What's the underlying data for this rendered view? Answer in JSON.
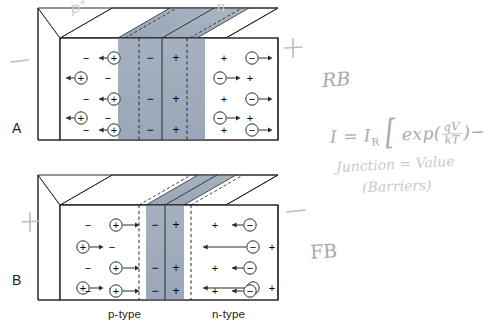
{
  "figure": {
    "colors": {
      "depletion_fill": "#9aa7b8",
      "depletion_fill_light": "#b6c0cd",
      "body_fill": "#ffffff",
      "outline": "#2b2b2b",
      "pencil": "#b9b9bd",
      "text": "#1d1d1d"
    }
  },
  "panels": [
    {
      "id": "A",
      "letter": "A",
      "bias_mode": "reverse",
      "terminal_left": "−",
      "terminal_right": "+",
      "p_side": {
        "fixed_charge_symbol": "−",
        "mobile_carrier_symbol": "+",
        "carrier_count": 5,
        "arrow_direction": "left",
        "rows": [
          {
            "fixed": "−",
            "carrier": "+",
            "carrier_side": "right"
          },
          {
            "fixed": "−",
            "carrier": "+",
            "carrier_side": "left"
          },
          {
            "fixed": "−",
            "carrier": "+",
            "carrier_side": "right"
          },
          {
            "fixed": "−",
            "carrier": "+",
            "carrier_side": "left"
          },
          {
            "fixed": "−",
            "carrier": "+",
            "carrier_side": "right"
          }
        ]
      },
      "n_side": {
        "fixed_charge_symbol": "+",
        "mobile_carrier_symbol": "−",
        "carrier_count": 5,
        "arrow_direction": "right",
        "rows": [
          {
            "fixed": "+",
            "carrier": "−",
            "carrier_side": "right"
          },
          {
            "fixed": "+",
            "carrier": "−",
            "carrier_side": "left"
          },
          {
            "fixed": "+",
            "carrier": "−",
            "carrier_side": "right"
          },
          {
            "fixed": "+",
            "carrier": "−",
            "carrier_side": "left"
          },
          {
            "fixed": "+",
            "carrier": "−",
            "carrier_side": "right"
          }
        ]
      },
      "depletion": {
        "width_label": "wide",
        "left_column_symbol": "−",
        "right_column_symbol": "+",
        "symbol_rows": 3
      }
    },
    {
      "id": "B",
      "letter": "B",
      "bias_mode": "forward",
      "terminal_left": "+",
      "terminal_right": "−",
      "p_side": {
        "fixed_charge_symbol": "−",
        "mobile_carrier_symbol": "+",
        "carrier_count": 5,
        "arrow_direction": "right",
        "rows": [
          {
            "fixed": "−",
            "carrier": "+",
            "carrier_side": "right"
          },
          {
            "fixed": "−",
            "carrier": "+",
            "carrier_side": "left"
          },
          {
            "fixed": "−",
            "carrier": "+",
            "carrier_side": "right"
          },
          {
            "fixed": "−",
            "carrier": "+",
            "carrier_side": "left"
          },
          {
            "fixed": "−",
            "carrier": "+",
            "carrier_side": "right"
          }
        ]
      },
      "n_side": {
        "fixed_charge_symbol": "+",
        "mobile_carrier_symbol": "−",
        "carrier_count": 5,
        "arrow_direction": "left",
        "rows": [
          {
            "fixed": "+",
            "carrier": "−",
            "carrier_side": "right"
          },
          {
            "fixed": "+",
            "carrier": "−",
            "carrier_side": "left"
          },
          {
            "fixed": "+",
            "carrier": "−",
            "carrier_side": "right"
          },
          {
            "fixed": "+",
            "carrier": "−",
            "carrier_side": "left"
          },
          {
            "fixed": "+",
            "carrier": "−",
            "carrier_side": "right"
          }
        ]
      },
      "depletion": {
        "width_label": "narrow",
        "left_column_symbol": "−",
        "right_column_symbol": "+",
        "symbol_rows": 3
      }
    }
  ],
  "axis_labels": {
    "p_type": "p-type",
    "n_type": "n-type"
  },
  "handwriting": {
    "top_p": "p",
    "top_p_sup": "+",
    "top_n": "n",
    "reverse_bias": "RB",
    "forward_bias": "FB",
    "equation": {
      "lhs": "I",
      "equals": "=",
      "prefactor": "I",
      "prefactor_sub": "R",
      "bracket_open": "[",
      "exp": "exp",
      "paren_open": "(",
      "frac_num": "qV",
      "frac_den": "kT",
      "paren_close": ")",
      "minus_tail": "−"
    },
    "note_line_1_left": "J",
    "note_line_1_rest": "unction",
    "note_line_1_equals": "=",
    "note_line_1_value": "Value",
    "note_line_2": "(Barriers)"
  }
}
